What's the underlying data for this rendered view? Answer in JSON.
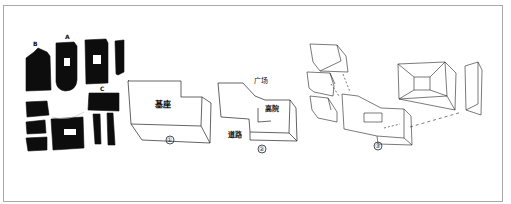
{
  "figure": {
    "type": "architectural concept sketch",
    "panels": [
      {
        "id": "site-plan",
        "description": "figure-ground plan of black building blocks",
        "markers": [
          {
            "label": "B"
          },
          {
            "label": "A"
          },
          {
            "label": "C"
          }
        ]
      },
      {
        "id": "step-1",
        "number_label": "①",
        "text_label": "基座"
      },
      {
        "id": "step-2",
        "number_label": "②",
        "labels": [
          {
            "text": "广场"
          },
          {
            "text": "高院"
          },
          {
            "text": "道路"
          }
        ]
      },
      {
        "id": "step-3",
        "number_label": "③",
        "description": "exploded axonometric of stacked frame volumes"
      }
    ]
  },
  "colors": {
    "ink": "#111111",
    "frame": "#a8a8a8",
    "paper": "#ffffff"
  }
}
